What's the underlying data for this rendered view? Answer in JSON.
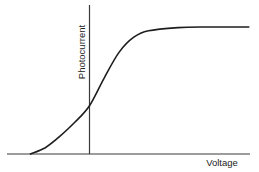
{
  "chart_data": {
    "type": "line",
    "title": "",
    "xlabel": "Voltage",
    "ylabel": "Photocurrent",
    "grid": false,
    "legend": null,
    "tick_labels": {
      "x": [],
      "y": []
    },
    "axis_position": {
      "y_axis_at_x": 0
    },
    "series": [
      {
        "name": "Photocurrent vs Voltage",
        "shape": "sigmoid (saturating)",
        "x": [
          -1.0,
          -0.75,
          -0.5,
          -0.25,
          0.0,
          0.25,
          0.5,
          0.75,
          1.0,
          1.5,
          2.0,
          2.7
        ],
        "y": [
          0.0,
          0.05,
          0.14,
          0.25,
          0.38,
          0.6,
          0.8,
          0.92,
          0.97,
          0.995,
          1.0,
          1.0
        ]
      }
    ],
    "annotations": []
  },
  "labels": {
    "x_axis": "Voltage",
    "y_axis": "Photocurrent"
  }
}
